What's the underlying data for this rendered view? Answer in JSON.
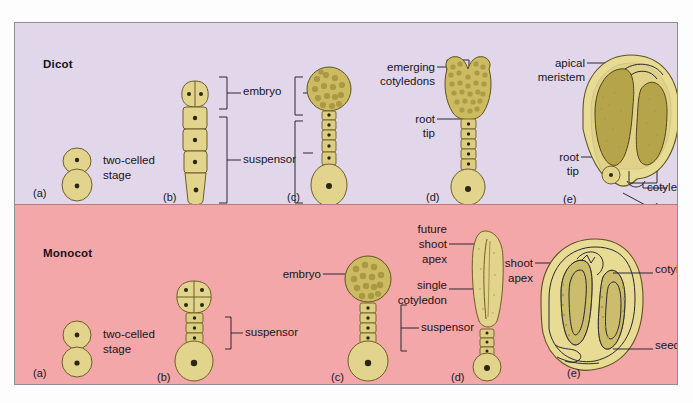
{
  "figure": {
    "clipped_header_text": "",
    "panels": [
      {
        "id": "dicot",
        "label": "Dicot",
        "background_color": "#e2d7ea",
        "stages": [
          {
            "letter": "(a)",
            "labels": [
              "two-celled",
              "stage"
            ],
            "description": "two-celled stage"
          },
          {
            "letter": "(b)",
            "labels": [
              "embryo",
              "suspensor"
            ],
            "description": "embryo with bracketed suspensor"
          },
          {
            "letter": "(c)",
            "labels": [],
            "description": "globular embryo on elongated suspensor"
          },
          {
            "letter": "(d)",
            "labels": [
              "emerging",
              "cotyledons",
              "root",
              "tip"
            ],
            "description": "heart stage with emerging cotyledons"
          },
          {
            "letter": "(e)",
            "labels": [
              "apical",
              "meristem",
              "root",
              "tip",
              "cotyledon",
              "seed coat"
            ],
            "description": "mature dicot seed in section"
          }
        ]
      },
      {
        "id": "monocot",
        "label": "Monocot",
        "background_color": "#f4a7a8",
        "stages": [
          {
            "letter": "(a)",
            "labels": [
              "two-celled",
              "stage"
            ],
            "description": "two-celled stage"
          },
          {
            "letter": "(b)",
            "labels": [
              "suspensor"
            ],
            "description": "early embryo with suspensor"
          },
          {
            "letter": "(c)",
            "labels": [
              "embryo",
              "suspensor"
            ],
            "description": "globular embryo with suspensor"
          },
          {
            "letter": "(d)",
            "labels": [
              "future",
              "shoot",
              "apex",
              "single",
              "cotyledon"
            ],
            "description": "elongate embryo with single cotyledon"
          },
          {
            "letter": "(e)",
            "labels": [
              "shoot",
              "apex",
              "cotyledon",
              "seed coat"
            ],
            "description": "mature monocot seed in section"
          }
        ]
      }
    ]
  },
  "text": {
    "dicot": "Dicot",
    "monocot": "Monocot",
    "two_celled": "two-celled",
    "stage": "stage",
    "embryo": "embryo",
    "suspensor": "suspensor",
    "emerging": "emerging",
    "cotyledons": "cotyledons",
    "root": "root",
    "tip": "tip",
    "apical": "apical",
    "meristem": "meristem",
    "cotyledon": "cotyledon",
    "seed_coat": "seed coat",
    "future": "future",
    "shoot": "shoot",
    "apex": "apex",
    "single": "single",
    "a": "(a)",
    "b": "(b)",
    "c": "(c)",
    "d": "(d)",
    "e": "(e)"
  },
  "colors": {
    "dicot_bg": "#e2d7ea",
    "monocot_bg": "#f4a7a8",
    "cell_fill": "#e2d48c",
    "embryo_mass": "#cdbb62",
    "seed_coat": "#e8dc95",
    "outline": "#6b5f28",
    "text": "#16151b"
  }
}
